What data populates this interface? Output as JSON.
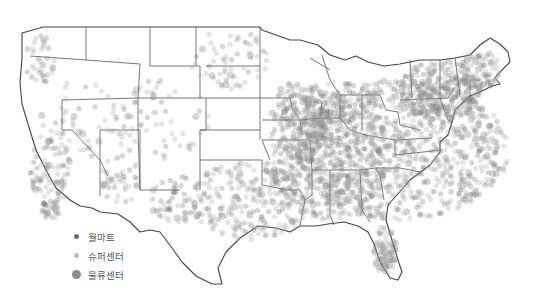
{
  "map": {
    "region": "Contiguous United States",
    "style": "dot distribution, grayscale, state boundaries",
    "colors": {
      "walmart": "#6e6e6e",
      "supercenter": "#b4b4b4",
      "distribution": "#8a8a8a",
      "border": "#555555"
    }
  },
  "legend": {
    "items": [
      {
        "label": "월마트",
        "color": "#6e6e6e",
        "size": 5
      },
      {
        "label": "슈퍼센터",
        "color": "#bdbdbd",
        "size": 5
      },
      {
        "label": "물류센터",
        "color": "#8c8c8c",
        "size": 9
      }
    ]
  }
}
